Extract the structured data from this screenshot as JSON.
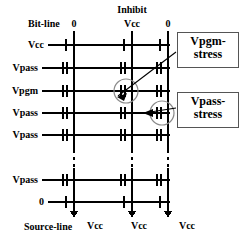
{
  "figure": {
    "type": "nand-flash-program-disturb-schematic",
    "bit_line_label": "Bit-line",
    "source_line_label": "Source-line",
    "inhibit_label": "Inhibit"
  },
  "top_bias": [
    {
      "name": "bitline-0-left",
      "value": "0"
    },
    {
      "name": "bitline-inhibit-center",
      "value": "Vcc"
    },
    {
      "name": "bitline-0-right",
      "value": "0"
    }
  ],
  "bottom_bias": [
    {
      "name": "source-select-left",
      "value": "Vcc"
    },
    {
      "name": "source-select-center",
      "value": "Vcc"
    },
    {
      "name": "source-select-right",
      "value": "Vcc"
    }
  ],
  "word_lines": [
    {
      "name": "drain-select-gate",
      "value": "Vcc",
      "kind": "select"
    },
    {
      "name": "word-line-1",
      "value": "Vpass",
      "kind": "cell"
    },
    {
      "name": "word-line-selected",
      "value": "Vpgm",
      "kind": "cell"
    },
    {
      "name": "word-line-3",
      "value": "Vpass",
      "kind": "cell"
    },
    {
      "name": "word-line-4",
      "value": "Vpass",
      "kind": "cell"
    },
    {
      "name": "word-line-n",
      "value": "Vpass",
      "kind": "cell"
    },
    {
      "name": "source-select-gate",
      "value": "0",
      "kind": "select"
    }
  ],
  "callouts": [
    {
      "name": "vpgm-stress",
      "line1": "Vpgm-",
      "line2": "stress"
    },
    {
      "name": "vpass-stress",
      "line1": "Vpass-",
      "line2": "stress"
    }
  ],
  "colors": {
    "line": "#000000",
    "callout_border": "#555555",
    "background": "#ffffff",
    "highlight_circle": "#888888"
  }
}
